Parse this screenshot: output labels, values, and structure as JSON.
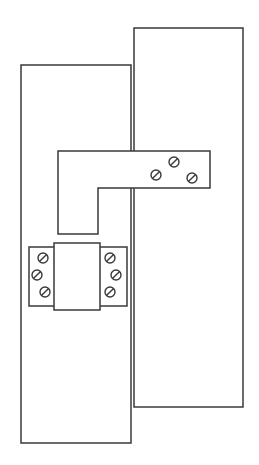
{
  "diagram": {
    "stroke_color": "#3a3a3a",
    "background_color": "#ffffff",
    "left_panel": {
      "x": 21,
      "y": 65,
      "width": 110,
      "height": 378
    },
    "right_panel": {
      "x": 134,
      "y": 28,
      "width": 109,
      "height": 379
    },
    "l_bracket": {
      "points": [
        [
          58,
          151
        ],
        [
          210,
          151
        ],
        [
          210,
          188
        ],
        [
          98,
          188
        ],
        [
          98,
          234
        ],
        [
          58,
          234
        ]
      ],
      "screws": [
        {
          "cx": 156,
          "cy": 175
        },
        {
          "cx": 174,
          "cy": 162
        },
        {
          "cx": 192,
          "cy": 178
        }
      ]
    },
    "terminal_block": {
      "outer": {
        "x": 29,
        "y": 247,
        "width": 98,
        "height": 59
      },
      "center": {
        "x": 54,
        "y": 243,
        "width": 46,
        "height": 67
      },
      "left_screws": [
        {
          "cx": 43,
          "cy": 258
        },
        {
          "cx": 37,
          "cy": 275
        },
        {
          "cx": 45,
          "cy": 292
        }
      ],
      "right_screws": [
        {
          "cx": 110,
          "cy": 258
        },
        {
          "cx": 116,
          "cy": 275
        },
        {
          "cx": 110,
          "cy": 292
        }
      ]
    },
    "screw_radius": 5
  }
}
